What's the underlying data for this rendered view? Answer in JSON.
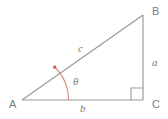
{
  "diagram": {
    "type": "right-triangle",
    "colors": {
      "line": "#9a9a9a",
      "label": "#7a7a7a",
      "angle_arc": "#e08878",
      "background": "#ffffff"
    },
    "vertices": [
      {
        "id": "A",
        "label": "A",
        "x": 22,
        "y": 100
      },
      {
        "id": "B",
        "label": "B",
        "x": 143,
        "y": 15
      },
      {
        "id": "C",
        "label": "C",
        "x": 143,
        "y": 100
      }
    ],
    "sides": [
      {
        "id": "a",
        "label": "a",
        "from": "B",
        "to": "C",
        "name": "opposite"
      },
      {
        "id": "b",
        "label": "b",
        "from": "A",
        "to": "C",
        "name": "adjacent"
      },
      {
        "id": "c",
        "label": "c",
        "from": "A",
        "to": "B",
        "name": "hypotenuse"
      }
    ],
    "angles": [
      {
        "id": "theta",
        "label": "θ",
        "at": "A",
        "marker": "arc"
      },
      {
        "id": "right-angle",
        "label": "",
        "at": "C",
        "marker": "square"
      }
    ]
  }
}
